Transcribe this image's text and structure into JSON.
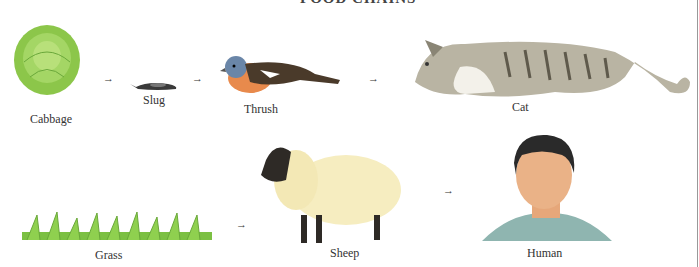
{
  "title": "FOOD CHAINS",
  "arrow_glyph": "→",
  "chains": [
    {
      "organisms": [
        "Cabbage",
        "Slug",
        "Thrush",
        "Cat"
      ]
    },
    {
      "organisms": [
        "Grass",
        "Sheep",
        "Human"
      ]
    }
  ],
  "labels": {
    "cabbage": "Cabbage",
    "slug": "Slug",
    "thrush": "Thrush",
    "cat": "Cat",
    "grass": "Grass",
    "sheep": "Sheep",
    "human": "Human"
  }
}
